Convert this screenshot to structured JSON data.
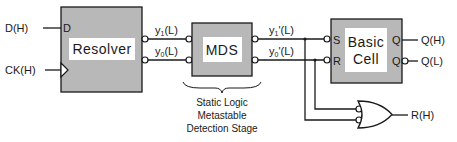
{
  "diagram": {
    "inputs": {
      "d": "D(H)",
      "ck": "CK(H)"
    },
    "resolver": {
      "label": "Resolver",
      "d_pin": "D",
      "fill": "#b8b8b8"
    },
    "signals": {
      "y1": "y",
      "y1_sub": "1",
      "y1_suffix": "(L)",
      "y0": "y",
      "y0_sub": "0",
      "y0_suffix": "(L)",
      "y1p": "y",
      "y1p_sub": "1",
      "y1p_suffix": "'(L)",
      "y0p": "y",
      "y0p_sub": "0",
      "y0p_suffix": "'(L)"
    },
    "mds": {
      "label": "MDS",
      "caption_lines": [
        "Static Logic",
        "Metastable",
        "Detection Stage"
      ]
    },
    "basic_cell": {
      "label_line1": "Basic",
      "label_line2": "Cell",
      "pin_s": "S",
      "pin_r": "R",
      "pin_q": "Q",
      "pin_qbar": "Q"
    },
    "outputs": {
      "qh": "Q(H)",
      "ql": "Q(L)",
      "rh": "R(H)"
    },
    "colors": {
      "block_fill": "#b8b8b8",
      "line": "#1a1a1a",
      "label_bg": "#ffffff"
    }
  }
}
